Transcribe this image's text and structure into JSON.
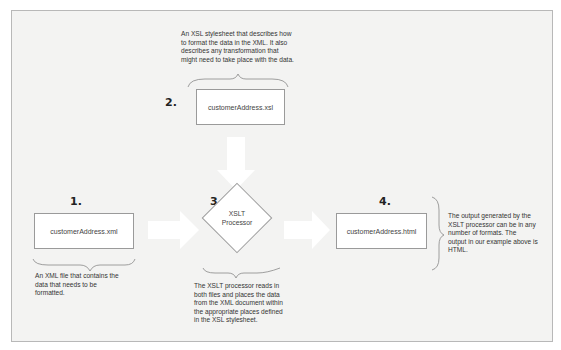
{
  "diagram": {
    "steps": [
      {
        "number": "1.",
        "label": "customerAddress.xml",
        "description": "An XML file that contains the data that needs to be formatted."
      },
      {
        "number": "2.",
        "label": "customerAddress.xsl",
        "description": "An XSL stylesheet that describes how to format the data in the XML. It also describes any transformation that might need to take place with the data."
      },
      {
        "number": "3.",
        "label_line1": "XSLT",
        "label_line2": "Processor",
        "description": "The XSLT processor reads in both files and places the data from the XML document within the appropriate places defined in the XSL stylesheet."
      },
      {
        "number": "4.",
        "label": "customerAddress.html",
        "description": "The output generated by the XSLT processor can be in any number of formats. The output in our example above is HTML."
      }
    ],
    "desc_lines": {
      "step1": [
        "An XML file that contains the",
        "data that needs to be",
        "formatted."
      ],
      "step2": [
        "An XSL stylesheet that describes how",
        "to format the data in the XML. It also",
        "describes any transformation that",
        "might need to take place with the data."
      ],
      "step3": [
        "The XSLT processor reads in",
        "both files and places the data",
        "from the XML document within",
        "the appropriate places defined",
        "in the XSL stylesheet."
      ],
      "step4": [
        "The output generated by the",
        "XSLT processor can be in any",
        "number of formats. The",
        "output in our example above is",
        "HTML."
      ]
    },
    "colors": {
      "background": "#f3f3f2",
      "box": "#ffffff",
      "border": "#9a9a9a",
      "arrow": "#ffffff"
    }
  }
}
